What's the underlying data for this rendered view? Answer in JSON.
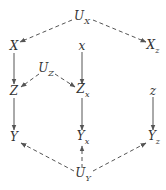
{
  "diagram": {
    "type": "causal-graph",
    "colors": {
      "edge": "#555555",
      "text": "#333333",
      "background": "#ffffff"
    },
    "nodes": [
      {
        "id": "UX",
        "base": "U",
        "sub": "X",
        "x": 82,
        "y": 18
      },
      {
        "id": "X",
        "base": "X",
        "sub": "",
        "x": 14,
        "y": 46
      },
      {
        "id": "x",
        "base": "x",
        "sub": "",
        "x": 82,
        "y": 46
      },
      {
        "id": "Xz",
        "base": "X",
        "sub": "z",
        "x": 153,
        "y": 47
      },
      {
        "id": "UZ",
        "base": "U",
        "sub": "Z",
        "x": 46,
        "y": 70
      },
      {
        "id": "Z",
        "base": "Z",
        "sub": "",
        "x": 14,
        "y": 91
      },
      {
        "id": "Zx",
        "base": "Z",
        "sub": "x",
        "x": 83,
        "y": 91
      },
      {
        "id": "z",
        "base": "z",
        "sub": "",
        "x": 153,
        "y": 91
      },
      {
        "id": "Y",
        "base": "Y",
        "sub": "",
        "x": 14,
        "y": 137
      },
      {
        "id": "Yx",
        "base": "Y",
        "sub": "x",
        "x": 83,
        "y": 138
      },
      {
        "id": "Yz",
        "base": "Y",
        "sub": "z",
        "x": 154,
        "y": 138
      },
      {
        "id": "UY",
        "base": "U",
        "sub": "Y",
        "x": 83,
        "y": 175
      }
    ],
    "edges": [
      {
        "from": "UX",
        "to": "X",
        "style": "dashed"
      },
      {
        "from": "UX",
        "to": "Xz",
        "style": "dashed"
      },
      {
        "from": "X",
        "to": "Z",
        "style": "solid"
      },
      {
        "from": "x",
        "to": "Zx",
        "style": "solid"
      },
      {
        "from": "UZ",
        "to": "Z",
        "style": "dashed"
      },
      {
        "from": "UZ",
        "to": "Zx",
        "style": "dashed"
      },
      {
        "from": "Z",
        "to": "Y",
        "style": "solid"
      },
      {
        "from": "Zx",
        "to": "Yx",
        "style": "solid"
      },
      {
        "from": "z",
        "to": "Yz",
        "style": "solid"
      },
      {
        "from": "UY",
        "to": "Y",
        "style": "dashed"
      },
      {
        "from": "UY",
        "to": "Yx",
        "style": "dashed"
      },
      {
        "from": "UY",
        "to": "Yz",
        "style": "dashed"
      }
    ]
  }
}
